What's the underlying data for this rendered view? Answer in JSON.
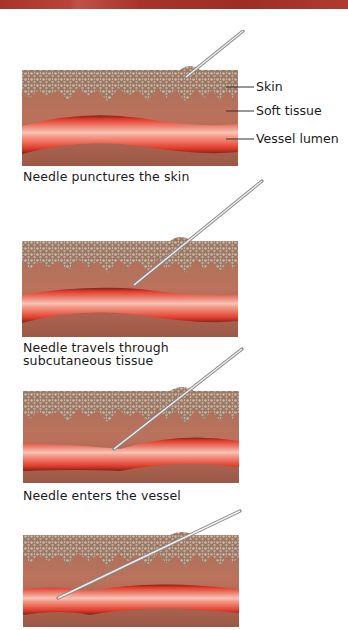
{
  "figure": {
    "labels": {
      "skin": "Skin",
      "soft_tissue": "Soft tissue",
      "vessel_lumen": "Vessel lumen"
    },
    "steps": [
      {
        "caption": "Needle punctures the skin"
      },
      {
        "caption": "Needle travels through subcutaneous tissue",
        "caption_line1": "Needle travels through",
        "caption_line2": "subcutaneous tissue"
      },
      {
        "caption": "Needle enters the vessel"
      },
      {
        "caption": ""
      }
    ]
  },
  "colors": {
    "skin_top": "#8a6a58",
    "skin_speckle": "#c7ad9c",
    "soft_tissue": "#b46a55",
    "vessel_outer": "#7a2418",
    "vessel_red": "#e8402e",
    "vessel_highlight": "#f6c0b0",
    "needle": "#c8c8c8",
    "header_bar": "#a8332a"
  }
}
